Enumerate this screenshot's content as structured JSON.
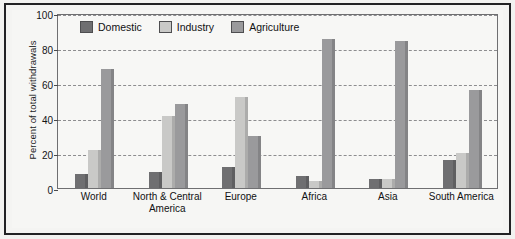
{
  "chart_data": {
    "type": "bar",
    "title": "",
    "xlabel": "",
    "ylabel": "Percent of total withdrawals",
    "ylim": [
      0,
      100
    ],
    "yticks": [
      0,
      20,
      40,
      60,
      80,
      100
    ],
    "grid": true,
    "legend_position": "top-left-inside",
    "categories": [
      "World",
      "North & Central America",
      "Europe",
      "Africa",
      "Asia",
      "South America"
    ],
    "series": [
      {
        "name": "Domestic",
        "color": "#6f6f71",
        "values": [
          8,
          9,
          12,
          7,
          5,
          16
        ]
      },
      {
        "name": "Industry",
        "color": "#c9c9c7",
        "values": [
          22,
          41,
          52,
          4,
          5,
          20
        ]
      },
      {
        "name": "Agriculture",
        "color": "#9a9a9c",
        "values": [
          68,
          48,
          30,
          85,
          84,
          56
        ]
      }
    ]
  },
  "axis": {
    "y_title": "Percent of total withdrawals",
    "tick_labels": [
      "0",
      "20",
      "40",
      "60",
      "80",
      "100"
    ]
  },
  "legend": {
    "items": [
      {
        "label": "Domestic"
      },
      {
        "label": "Industry"
      },
      {
        "label": "Agriculture"
      }
    ]
  },
  "categories": [
    {
      "line1": "World",
      "line2": ""
    },
    {
      "line1": "North & Central",
      "line2": "America"
    },
    {
      "line1": "Europe",
      "line2": ""
    },
    {
      "line1": "Africa",
      "line2": ""
    },
    {
      "line1": "Asia",
      "line2": ""
    },
    {
      "line1": "South America",
      "line2": ""
    }
  ],
  "colors": {
    "domestic": "#6f6f71",
    "industry": "#c9c9c7",
    "agriculture": "#9a9a9c",
    "frame": "#222224",
    "background": "#f6f6f4",
    "gridline": "#8d8d8f"
  }
}
